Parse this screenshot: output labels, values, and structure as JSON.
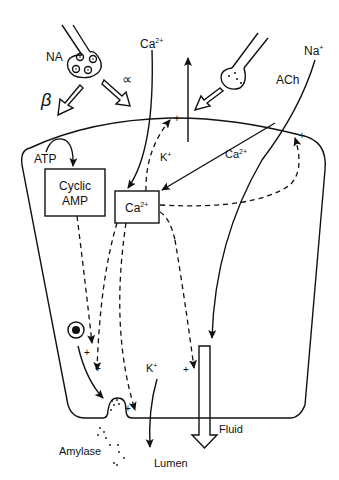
{
  "diagram": {
    "type": "cell-secretion-schematic",
    "labels": {
      "na": "NA",
      "beta": "β",
      "alpha": "∝",
      "ca_top": "Ca",
      "ca_sup": "2+",
      "ach": "ACh",
      "na_ion": "Na",
      "na_sup": "+",
      "atp": "ATP",
      "cyclic1": "Cyclic",
      "cyclic2": "AMP",
      "ca_box": "Ca",
      "ca_box_sup": "2+",
      "k_in": "K",
      "k_in_sup": "+",
      "ca_in": "Ca",
      "ca_in_sup": "2+",
      "k_lumen": "K",
      "k_lumen_sup": "+",
      "fluid": "Fluid",
      "amylase": "Amylase",
      "lumen": "Lumen",
      "plus": "+"
    },
    "colors": {
      "ink": "#111111",
      "background": "#ffffff"
    }
  }
}
